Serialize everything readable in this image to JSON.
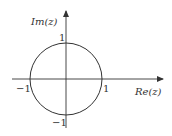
{
  "diagram": {
    "axes": {
      "x_label": "Re(z)",
      "y_label": "Im(z)"
    },
    "ticks": {
      "x_pos": "1",
      "x_neg": "−1",
      "y_pos": "1",
      "y_neg": "−1"
    },
    "circle": {
      "center": [
        0,
        0
      ],
      "radius": 1
    },
    "colors": {
      "stroke": "#333333",
      "background": "#ffffff"
    }
  }
}
